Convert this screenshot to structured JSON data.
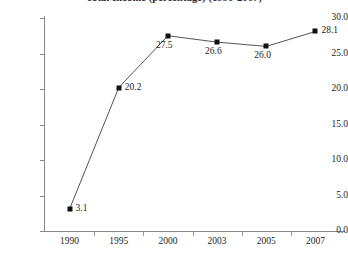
{
  "chart_data": {
    "type": "line",
    "title": "Total Income (percentage) (1990-2007)",
    "xlabel": "",
    "ylabel": "",
    "categories": [
      "1990",
      "1995",
      "2000",
      "2003",
      "2005",
      "2007"
    ],
    "values": [
      3.1,
      20.2,
      27.5,
      26.6,
      26.0,
      28.1
    ],
    "point_labels": [
      "3.1",
      "20.2",
      "27.5",
      "26.6",
      "26.0",
      "28.1"
    ],
    "ylim": [
      0.0,
      30.0
    ],
    "y_ticks": [
      0.0,
      5.0,
      10.0,
      15.0,
      20.0,
      25.0,
      30.0
    ],
    "y_tick_labels": [
      "0.0",
      "5.0",
      "10.0",
      "15.0",
      "20.0",
      "25.0",
      "30.0"
    ],
    "grid": false,
    "legend": false,
    "marker": "square",
    "series_color": "#111111",
    "line_color": "#555555"
  }
}
